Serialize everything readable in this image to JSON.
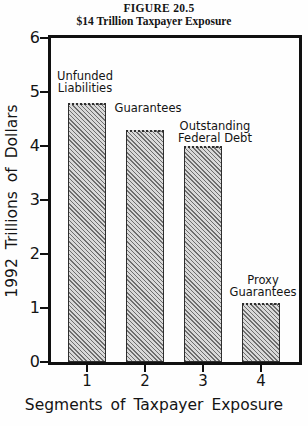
{
  "figure": {
    "title": "FIGURE 20.5",
    "subtitle": "$14 Trillion Taxpayer Exposure"
  },
  "chart_data": {
    "type": "bar",
    "title": "FIGURE 20.5",
    "subtitle": "$14 Trillion Taxpayer Exposure",
    "categories": [
      "1",
      "2",
      "3",
      "4"
    ],
    "values": [
      4.8,
      4.3,
      4.0,
      1.1
    ],
    "bar_labels": [
      [
        "Unfunded",
        "Liabilities"
      ],
      [
        "Guarantees"
      ],
      [
        "Outstanding",
        "Federal Debt"
      ],
      [
        "Proxy",
        "Guarantees"
      ]
    ],
    "xlabel": "Segments of Taxpayer Exposure",
    "ylabel": "1992 Trillions of Dollars",
    "ylim": [
      0,
      6
    ],
    "yticks": [
      0,
      1,
      2,
      3,
      4,
      5,
      6
    ],
    "grid": false,
    "legend": "none",
    "bar_fill": "diagonal-hatch",
    "colors": {
      "frame": "#101010",
      "text": "#141414",
      "hatch_dark": "#6e6e6e",
      "hatch_light": "#d9d9d9",
      "background": "#fefefe"
    }
  }
}
